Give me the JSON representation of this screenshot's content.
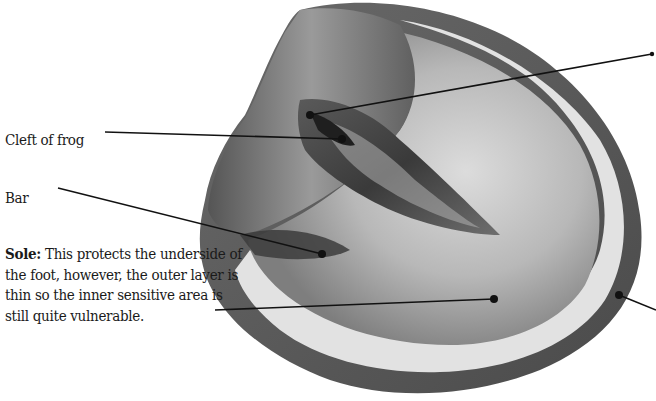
{
  "diagram": {
    "labels": {
      "cleft_of_frog": "Cleft of frog",
      "bar": "Bar",
      "sole_term": "Sole:",
      "sole_desc": " This protects the underside of the foot, however, the outer layer is thin so the inner sensitive area is still quite vulnerable."
    },
    "leader_lines": [
      {
        "label": "cleft-of-frog",
        "from": [
          105,
          132
        ],
        "to": [
          342,
          139
        ]
      },
      {
        "label": "bar",
        "from": [
          58,
          188
        ],
        "to": [
          322,
          254
        ]
      },
      {
        "label": "sole",
        "from": [
          215,
          310
        ],
        "to": [
          494,
          299
        ]
      },
      {
        "label": "offscreen-top-right",
        "from": [
          656,
          56
        ],
        "to": [
          310,
          115
        ]
      },
      {
        "label": "offscreen-bottom-right",
        "from": [
          656,
          310
        ],
        "to": [
          619,
          295
        ]
      }
    ],
    "colors": {
      "line": "#111111",
      "text": "#1a1a1a",
      "hoof_dark": "#4a4a4a",
      "hoof_mid": "#8a8a8a",
      "hoof_light": "#d8d8d8",
      "white_line": "#e6e6e6"
    }
  }
}
